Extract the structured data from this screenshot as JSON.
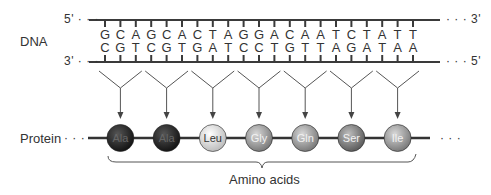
{
  "diagram": {
    "dna_label": "DNA",
    "protein_label": "Protein",
    "amino_acids_label": "Amino acids",
    "top_strand": {
      "left_end": "5'",
      "right_end": "3'",
      "bases": [
        "G",
        "C",
        "A",
        "G",
        "C",
        "A",
        "C",
        "T",
        "A",
        "G",
        "G",
        "A",
        "C",
        "A",
        "A",
        "T",
        "C",
        "T",
        "A",
        "T",
        "T"
      ]
    },
    "bottom_strand": {
      "left_end": "3'",
      "right_end": "5'",
      "bases": [
        "C",
        "G",
        "T",
        "C",
        "G",
        "T",
        "G",
        "A",
        "T",
        "C",
        "C",
        "T",
        "G",
        "T",
        "T",
        "A",
        "G",
        "A",
        "T",
        "A",
        "A"
      ]
    },
    "codons": [
      "GCA",
      "GCA",
      "CTA",
      "GGA",
      "CAA",
      "TCT",
      "ATT"
    ],
    "amino_acids": [
      {
        "name": "Ala",
        "shade": "dark"
      },
      {
        "name": "Ala",
        "shade": "dark"
      },
      {
        "name": "Leu",
        "shade": "light"
      },
      {
        "name": "Gly",
        "shade": "medium"
      },
      {
        "name": "Gln",
        "shade": "medium"
      },
      {
        "name": "Ser",
        "shade": "medium-dark"
      },
      {
        "name": "Ile",
        "shade": "medium"
      }
    ],
    "ellipsis": "· · ·",
    "colors": {
      "dark": "#222222",
      "light": "#e6e6e6",
      "medium": "#9a9a9a",
      "medium-dark": "#7f7f7f",
      "line": "#3a3a3a"
    }
  }
}
